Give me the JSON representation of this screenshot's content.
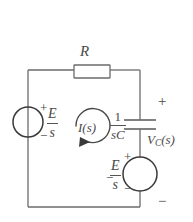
{
  "diagram": {
    "type": "electrical-schematic",
    "width": 193,
    "height": 222,
    "stroke_color": "#6b6b6b",
    "text_color": "#4a4a4a",
    "background": "#ffffff"
  },
  "components": {
    "resistor": {
      "name": "resistor",
      "label": "R",
      "position": "top-branch"
    },
    "source_left": {
      "name": "voltage-source-left",
      "symbol": "circle",
      "label_numerator": "E",
      "label_denominator": "s",
      "plus": "+",
      "minus": "−",
      "position": "left-branch"
    },
    "capacitor": {
      "name": "capacitor",
      "impedance_numerator": "1",
      "impedance_denominator": "sC",
      "position": "middle-branch-upper"
    },
    "source_right": {
      "name": "voltage-source-right",
      "symbol": "circle",
      "label_numerator": "E",
      "label_denominator": "s",
      "plus": "+",
      "minus": "−",
      "position": "middle-branch-lower"
    },
    "mesh_current": {
      "name": "mesh-current-loop",
      "label": "I(s)",
      "direction": "clockwise"
    },
    "output_voltage": {
      "name": "output-voltage",
      "label_main": "V",
      "label_sub": "C",
      "label_arg": "(s)",
      "plus": "+",
      "minus": "−",
      "position": "right-branch"
    }
  }
}
